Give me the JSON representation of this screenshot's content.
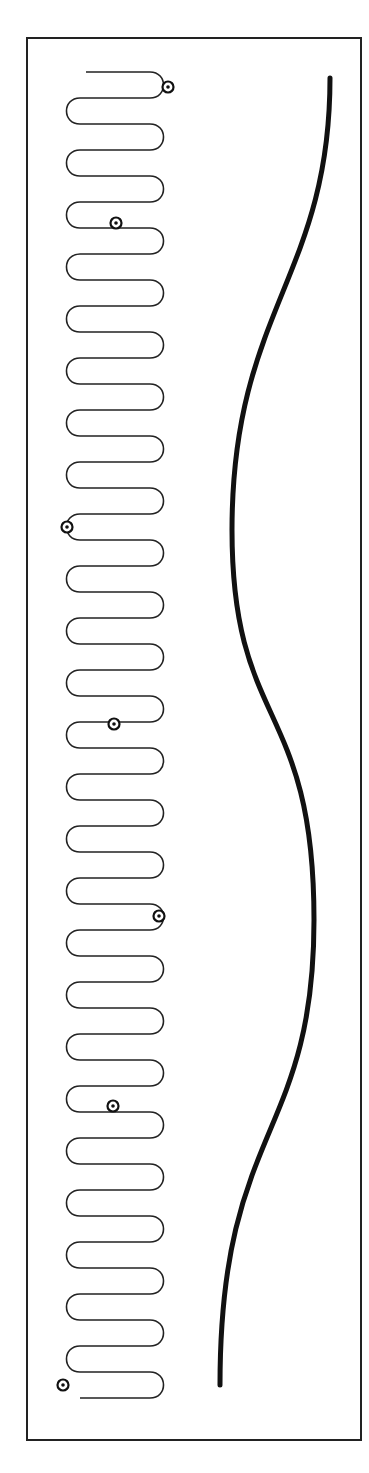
{
  "diagram": {
    "frame": {
      "x": 26,
      "y": 37,
      "width": 336,
      "height": 1404,
      "stroke": "#222222"
    },
    "serpentine": {
      "left_x": 66,
      "right_x": 164,
      "start_y": 72,
      "row_spacing": 26,
      "rows": 51,
      "start_x": 86,
      "stroke": "#222222",
      "stroke_width": 1.6
    },
    "markers": [
      {
        "x": 168,
        "y": 87
      },
      {
        "x": 116,
        "y": 223
      },
      {
        "x": 67,
        "y": 527
      },
      {
        "x": 114,
        "y": 724
      },
      {
        "x": 159,
        "y": 916
      },
      {
        "x": 113,
        "y": 1106
      },
      {
        "x": 63,
        "y": 1385
      }
    ],
    "wave": {
      "points": [
        [
          330,
          78
        ],
        [
          232,
          530
        ],
        [
          314,
          920
        ],
        [
          220,
          1385
        ]
      ],
      "stroke": "#111111",
      "stroke_width": 5
    }
  }
}
